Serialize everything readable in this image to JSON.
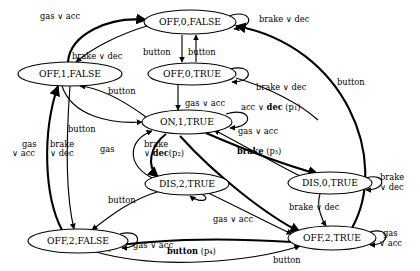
{
  "diagram": {
    "type": "state-transition-graph",
    "title": "",
    "nodes": [
      {
        "id": "off0false",
        "label": "OFF,0,FALSE",
        "cx": 190,
        "cy": 22,
        "rx": 46,
        "ry": 12
      },
      {
        "id": "off1false",
        "label": "OFF,1,FALSE",
        "cx": 70,
        "cy": 74,
        "rx": 52,
        "ry": 12
      },
      {
        "id": "off0true",
        "label": "OFF,0,TRUE",
        "cx": 192,
        "cy": 74,
        "rx": 44,
        "ry": 11
      },
      {
        "id": "on1true",
        "label": "ON,1,TRUE",
        "cx": 187,
        "cy": 122,
        "rx": 45,
        "ry": 12
      },
      {
        "id": "dis2true",
        "label": "DIS,2,TRUE",
        "cx": 187,
        "cy": 184,
        "rx": 42,
        "ry": 11
      },
      {
        "id": "dis0true",
        "label": "DIS,0,TRUE",
        "cx": 330,
        "cy": 183,
        "rx": 42,
        "ry": 11
      },
      {
        "id": "off2false",
        "label": "OFF,2,FALSE",
        "cx": 78,
        "cy": 241,
        "rx": 50,
        "ry": 12
      },
      {
        "id": "off2true",
        "label": "OFF,2,TRUE",
        "cx": 332,
        "cy": 238,
        "rx": 44,
        "ry": 12
      }
    ],
    "labels": [
      {
        "id": "l-gas-acc-top",
        "text": "gas ∨ acc",
        "x": 40,
        "y": 12,
        "bold": false
      },
      {
        "id": "l-brake-dec-top",
        "text": "brake ∨ dec",
        "x": 72,
        "y": 52,
        "bold": false
      },
      {
        "id": "l-button-1",
        "text": "button",
        "x": 143,
        "y": 48,
        "bold": false
      },
      {
        "id": "l-button-2",
        "text": "button",
        "x": 188,
        "y": 48,
        "bold": false
      },
      {
        "id": "l-brake-dec-r1",
        "text": "brake ∨ dec",
        "x": 259,
        "y": 15,
        "bold": false
      },
      {
        "id": "l-brake-dec-r2",
        "text": "brake ∨ dec",
        "x": 256,
        "y": 83,
        "bold": false
      },
      {
        "id": "l-button-right",
        "text": "button",
        "x": 337,
        "y": 78,
        "bold": false
      },
      {
        "id": "l-button-3",
        "text": "button",
        "x": 108,
        "y": 87,
        "bold": false
      },
      {
        "id": "l-gas-acc-2",
        "text": "gas ∨ acc",
        "x": 185,
        "y": 99,
        "bold": false
      },
      {
        "id": "l-button-4",
        "text": "button",
        "x": 68,
        "y": 125,
        "bold": false
      },
      {
        "id": "l-gas-acc-3",
        "text": "gas ∨ acc",
        "x": 238,
        "y": 127,
        "bold": false
      },
      {
        "id": "l-gas",
        "text": "gas",
        "x": 100,
        "y": 145,
        "bold": false
      },
      {
        "id": "l-brake-dec-p2-1",
        "text": "brake",
        "x": 144,
        "y": 142,
        "bold": false
      },
      {
        "id": "l-brake-dec-p2-2",
        "text": "∨ ",
        "x": 144,
        "y": 151,
        "bold": false
      },
      {
        "id": "l-gas-acc-left-1",
        "text": "gas",
        "x": 22,
        "y": 142,
        "bold": false
      },
      {
        "id": "l-gas-acc-left-2",
        "text": "∨ acc",
        "x": 15,
        "y": 151,
        "bold": false
      },
      {
        "id": "l-brake-dec-left-1",
        "text": "brake",
        "x": 50,
        "y": 142,
        "bold": false
      },
      {
        "id": "l-brake-dec-left-2",
        "text": "∨ dec",
        "x": 50,
        "y": 151,
        "bold": false
      },
      {
        "id": "l-button-5",
        "text": "button",
        "x": 108,
        "y": 196,
        "bold": false
      },
      {
        "id": "l-brake-dec-r3-1",
        "text": "brake",
        "x": 380,
        "y": 177,
        "bold": false
      },
      {
        "id": "l-brake-dec-r3-2",
        "text": "∨ dec",
        "x": 380,
        "y": 187,
        "bold": false
      },
      {
        "id": "l-brake-dec-r4",
        "text": "brake ∨ dec",
        "x": 289,
        "y": 203,
        "bold": false
      },
      {
        "id": "l-gas-acc-4",
        "text": "gas ∨ acc",
        "x": 213,
        "y": 215,
        "bold": false
      },
      {
        "id": "l-gas-acc-r-1",
        "text": "gas",
        "x": 383,
        "y": 233,
        "bold": false
      },
      {
        "id": "l-gas-acc-r-2",
        "text": "∨ acc",
        "x": 381,
        "y": 243,
        "bold": false
      },
      {
        "id": "l-gas-acc-5",
        "text": "gas ∨ acc",
        "x": 133,
        "y": 241,
        "bold": false
      },
      {
        "id": "l-button-6",
        "text": "button",
        "x": 273,
        "y": 258,
        "bold": false
      }
    ],
    "annotated_labels": [
      {
        "id": "l-acc-dec-p1",
        "prefix": "acc ∨ ",
        "bold": "dec",
        "suffix": " (p₁)",
        "x": 241,
        "y": 106
      },
      {
        "id": "l-brake-dec-p2",
        "prefix": "∨ ",
        "bold": "dec",
        "suffix": "(p₂)",
        "x": 144,
        "y": 152
      },
      {
        "id": "l-brake-p3",
        "prefix": "",
        "bold": "brake",
        "suffix": " (p₃)",
        "x": 237,
        "y": 151
      },
      {
        "id": "l-button-p4",
        "prefix": "",
        "bold": "button",
        "suffix": " (p₄)",
        "x": 167,
        "y": 250
      }
    ],
    "symbols": {
      "or": "∨",
      "p1": "p₁",
      "p2": "p₂",
      "p3": "p₃",
      "p4": "p₄"
    },
    "colors": {
      "stroke": "#000000",
      "background": "#ffffff",
      "text": "#000000"
    }
  }
}
